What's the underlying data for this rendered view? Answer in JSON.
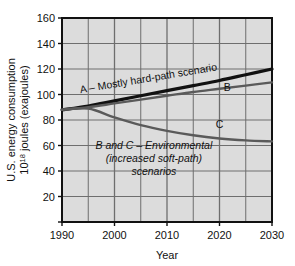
{
  "chart_data": {
    "type": "line",
    "title": "",
    "xlabel": "Year",
    "ylabel": "U.S. energy consumption 10^18 joules (exajoules)",
    "ylabel_line1": "U.S. energy consumption",
    "ylabel_line2_pre": "10",
    "ylabel_line2_sup": "18",
    "ylabel_line2_post": " joules (exajoules)",
    "xlim": [
      1990,
      2030
    ],
    "ylim": [
      0,
      160
    ],
    "grid": true,
    "grid_major_x": [
      1990,
      2000,
      2010,
      2020,
      2030
    ],
    "grid_minor_x": [
      1995,
      2005,
      2015,
      2025
    ],
    "legend_position": "inline-annotations",
    "xticks": [
      "1990",
      "2000",
      "2010",
      "2020",
      "2030"
    ],
    "xtick_values": [
      1990,
      2000,
      2010,
      2020,
      2030
    ],
    "yticks": [
      "20",
      "40",
      "60",
      "80",
      "100",
      "120",
      "140",
      "160"
    ],
    "ytick_values": [
      20,
      40,
      60,
      80,
      100,
      120,
      140,
      160
    ],
    "x": [
      1990,
      1995,
      2000,
      2005,
      2010,
      2015,
      2020,
      2025,
      2030
    ],
    "series": [
      {
        "name": "A",
        "label": "A – Mostly hard-path scenario",
        "color": "#111111",
        "width": 3.2,
        "values": [
          88,
          91,
          95,
          99,
          103,
          107,
          111,
          115.5,
          120
        ]
      },
      {
        "name": "B",
        "label": "B",
        "color": "#5a5a5a",
        "width": 2.4,
        "values": [
          88,
          90,
          93,
          96,
          99,
          102,
          104.5,
          107,
          109.5
        ]
      },
      {
        "name": "C",
        "label": "C",
        "color": "#5a5a5a",
        "width": 2.4,
        "values": [
          88,
          89,
          82,
          76,
          71.5,
          68,
          65.5,
          64,
          63.2
        ]
      }
    ],
    "annotations": [
      {
        "name": "series-a-annotation",
        "text": "A – Mostly hard-path scenario",
        "style": "upright",
        "x": 1993.5,
        "y": 101
      },
      {
        "name": "series-b-annotation",
        "text": "B",
        "style": "upright",
        "x": 2021.5,
        "y": 103
      },
      {
        "name": "series-c-annotation",
        "text": "C",
        "style": "upright",
        "x": 2020.0,
        "y": 74
      },
      {
        "name": "environmental-note-line1",
        "text": "B and C – Environmental",
        "style": "italic"
      },
      {
        "name": "environmental-note-line2",
        "text": "(increased soft-path)",
        "style": "italic"
      },
      {
        "name": "environmental-note-line3",
        "text": "scenarios",
        "style": "italic"
      }
    ],
    "colors": {
      "plot_background": "#dcdcdc",
      "gridline": "#6e6e6e",
      "axis": "#111111",
      "page_background": "#ffffff",
      "series_a": "#111111",
      "series_bc": "#5a5a5a"
    }
  }
}
